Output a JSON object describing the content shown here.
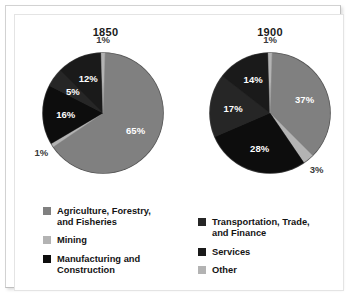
{
  "figure": {
    "background_color": "#ffffff",
    "border_color": "#e4e4e4"
  },
  "colors": {
    "agriculture": "#808080",
    "mining": "#b3b3b3",
    "manufacturing": "#0d0d0d",
    "transportation": "#262626",
    "services": "#1a1a1a",
    "other": "#b3b3b3",
    "label_inside": "#ffffff",
    "label_outside": "#3a3a3a"
  },
  "panels": [
    {
      "id": "panel-1850",
      "title": "1850"
    },
    {
      "id": "panel-1900",
      "title": "1900"
    }
  ],
  "legend": {
    "left_items": [
      {
        "label": "Agriculture, Forestry,\nand Fisheries",
        "color": "#808080",
        "key": "agriculture"
      },
      {
        "label": "Mining",
        "color": "#b3b3b3",
        "key": "mining"
      },
      {
        "label": "Manufacturing and\nConstruction",
        "color": "#0d0d0d",
        "key": "manufacturing"
      }
    ],
    "right_items": [
      {
        "label": "Transportation, Trade,\nand Finance",
        "color": "#262626",
        "key": "transportation"
      },
      {
        "label": "Services",
        "color": "#1a1a1a",
        "key": "services"
      },
      {
        "label": "Other",
        "color": "#b3b3b3",
        "key": "other"
      }
    ]
  },
  "chart_data": [
    {
      "type": "pie",
      "title": "1850",
      "xlabel": "",
      "ylabel": "",
      "legend_position": "bottom-left",
      "categories": [
        "Agriculture, Forestry, and Fisheries",
        "Mining",
        "Manufacturing and Construction",
        "Transportation, Trade, and Finance",
        "Services",
        "Other"
      ],
      "values": [
        65,
        1,
        16,
        5,
        12,
        1
      ],
      "labels": [
        "65%",
        "1%",
        "16%",
        "5%",
        "12%",
        "1%"
      ],
      "colors": [
        "#808080",
        "#b3b3b3",
        "#0d0d0d",
        "#262626",
        "#1a1a1a",
        "#b3b3b3"
      ],
      "label_placement": [
        "inside",
        "outside",
        "inside",
        "inside",
        "inside",
        "outside"
      ]
    },
    {
      "type": "pie",
      "title": "1900",
      "xlabel": "",
      "ylabel": "",
      "legend_position": "bottom-right",
      "categories": [
        "Agriculture, Forestry, and Fisheries",
        "Mining",
        "Manufacturing and Construction",
        "Transportation, Trade, and Finance",
        "Services",
        "Other"
      ],
      "values": [
        37,
        3,
        28,
        17,
        14,
        1
      ],
      "labels": [
        "37%",
        "3%",
        "28%",
        "17%",
        "14%",
        "1%"
      ],
      "colors": [
        "#808080",
        "#b3b3b3",
        "#0d0d0d",
        "#262626",
        "#1a1a1a",
        "#b3b3b3"
      ],
      "label_placement": [
        "inside",
        "outside",
        "inside",
        "inside",
        "inside",
        "outside"
      ]
    }
  ]
}
